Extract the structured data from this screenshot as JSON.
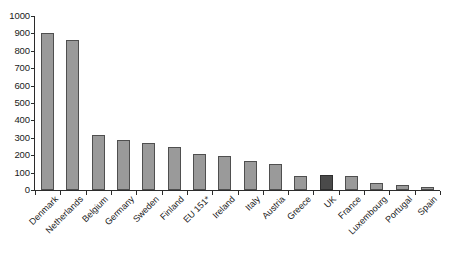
{
  "chart_data": {
    "type": "bar",
    "title": "",
    "subtitle": "",
    "xlabel": "",
    "ylabel": "",
    "ylim": [
      0,
      1000
    ],
    "ytick_step": 100,
    "yticks": [
      "1000",
      "900",
      "800",
      "700",
      "600",
      "500",
      "400",
      "300",
      "200",
      "100",
      "0"
    ],
    "grid": false,
    "legend": "none",
    "categories": [
      "Denmark",
      "Netherlands",
      "Belgium",
      "Germany",
      "Sweden",
      "Finland",
      "EU 151*",
      "Ireland",
      "Italy",
      "Austria",
      "Greece",
      "UK",
      "France",
      "Luxembourg",
      "Portugal",
      "Spain"
    ],
    "values": [
      900,
      865,
      315,
      285,
      270,
      250,
      205,
      195,
      165,
      150,
      82,
      85,
      80,
      40,
      28,
      18
    ],
    "highlight_category": "UK",
    "colors": {
      "bar_fill": "#9a9a9a",
      "bar_border": "#4f4f4f",
      "highlight_fill": "#4a4a4a",
      "highlight_border": "#2f2f2f",
      "axis": "#2b2b2b",
      "background": "#ffffff",
      "text": "#1a1a1a"
    },
    "footnote_marker": "*"
  }
}
